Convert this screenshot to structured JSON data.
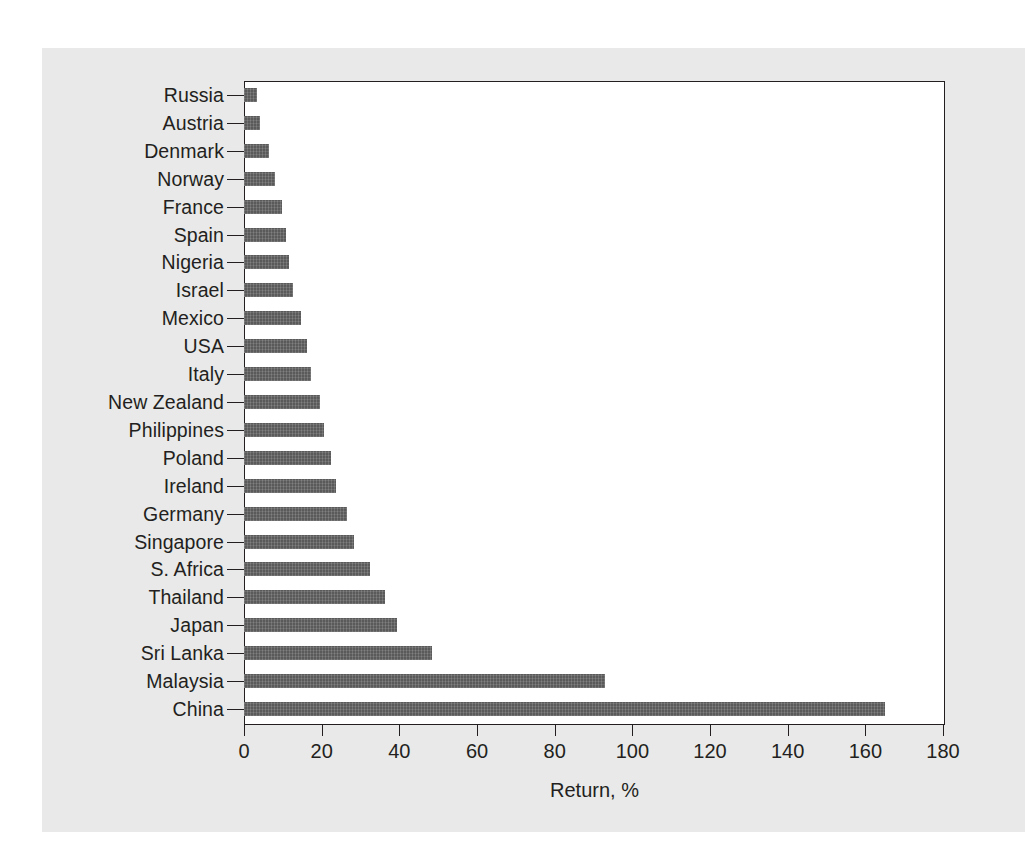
{
  "chart_data": {
    "type": "bar",
    "orientation": "horizontal",
    "title": "",
    "subtitle": "",
    "xlabel": "Return, %",
    "ylabel": "",
    "xlim": [
      0,
      180
    ],
    "xticks": [
      0,
      20,
      40,
      60,
      80,
      100,
      120,
      140,
      160,
      180
    ],
    "ytick_labels": [
      "Russia",
      "Austria",
      "Denmark",
      "Norway",
      "France",
      "Spain",
      "Nigeria",
      "Israel",
      "Mexico",
      "USA",
      "Italy",
      "New Zealand",
      "Philippines",
      "Poland",
      "Ireland",
      "Germany",
      "Singapore",
      "S. Africa",
      "Thailand",
      "Japan",
      "Sri Lanka",
      "Malaysia",
      "China"
    ],
    "grid": false,
    "legend": false,
    "legend_position": "none",
    "bar_color": "#5a5a5a",
    "plot_background": "#ffffff",
    "figure_background": "#e9e9e9",
    "axis_color": "#231f20",
    "categories": [
      "Russia",
      "Austria",
      "Denmark",
      "Norway",
      "France",
      "Spain",
      "Nigeria",
      "Israel",
      "Mexico",
      "USA",
      "Italy",
      "New Zealand",
      "Philippines",
      "Poland",
      "Ireland",
      "Germany",
      "Singapore",
      "S. Africa",
      "Thailand",
      "Japan",
      "Sri Lanka",
      "Malaysia",
      "China"
    ],
    "values": [
      3.4,
      4.2,
      6.4,
      8.0,
      9.8,
      10.8,
      11.6,
      12.6,
      14.6,
      16.2,
      17.2,
      19.6,
      20.6,
      22.4,
      23.6,
      26.4,
      28.2,
      32.4,
      36.4,
      39.4,
      48.4,
      93.0,
      165.0
    ]
  }
}
